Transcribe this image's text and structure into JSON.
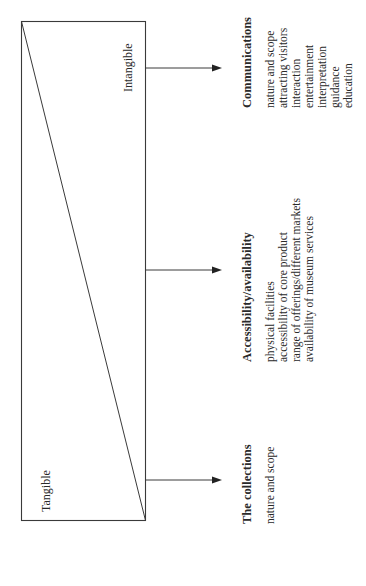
{
  "diagram": {
    "box_labels": {
      "intangible": "Intangible",
      "tangible": "Tangible"
    },
    "categories": [
      {
        "id": "communications",
        "title": "Communications",
        "items": [
          "nature and scope",
          "attracting visitors",
          "interaction",
          "entertainment",
          "interpretation",
          "guidance",
          "education"
        ]
      },
      {
        "id": "accessibility",
        "title": "Accessibility/availability",
        "items": [
          "physical facilities",
          "accessibility of core product",
          "range of offerings/different markets",
          "availability of museum services"
        ]
      },
      {
        "id": "collections",
        "title": "The collections",
        "items": [
          "nature and scope"
        ]
      }
    ],
    "colors": {
      "line": "#3a3a3a",
      "text": "#2a2a2a",
      "background": "#ffffff"
    }
  }
}
